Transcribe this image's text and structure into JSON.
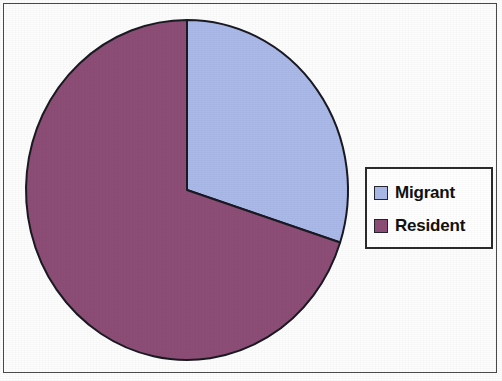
{
  "figure": {
    "background_color": "#fdfdfd",
    "frame_color": "#4a4a4a"
  },
  "legend": {
    "position": "right",
    "border_color": "#2b2b2b",
    "background_color": "#ffffff",
    "entries": [
      {
        "label": "Migrant",
        "color": "#aab9e9"
      },
      {
        "label": "Resident",
        "color": "#8d4d76"
      }
    ]
  },
  "chart_data": {
    "type": "pie",
    "title": "",
    "subtitle": "",
    "xlabel": "",
    "ylabel": "",
    "grid": false,
    "legend_position": "right",
    "start_angle_deg": 0,
    "direction": "clockwise",
    "outline_color": "#1a1a22",
    "categories": [
      "Migrant",
      "Resident"
    ],
    "values": [
      30,
      70
    ],
    "value_unit": "percent",
    "slices": [
      {
        "label": "Migrant",
        "value": 30,
        "percent": 30,
        "color": "#aab9e9",
        "start_angle_deg": 0,
        "end_angle_deg": 108
      },
      {
        "label": "Resident",
        "value": 70,
        "percent": 70,
        "color": "#8d4d76",
        "start_angle_deg": 108,
        "end_angle_deg": 360
      }
    ],
    "annotations": []
  },
  "geometry": {
    "center_x": 167,
    "center_y": 178,
    "radius_x": 161,
    "radius_y": 170
  }
}
